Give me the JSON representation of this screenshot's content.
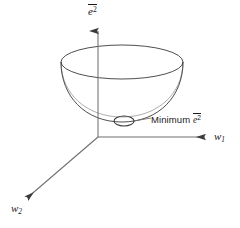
{
  "figure": {
    "background_color": "#ffffff",
    "stroke_color": "#3a3a3a",
    "text_color": "#1a1a1a",
    "width": 240,
    "height": 228
  },
  "axes": {
    "vertical": {
      "name": "vertical-axis",
      "base_symbol": "e",
      "superscript": "2",
      "has_overbar": true,
      "label_plain": "e̅2",
      "direction": "up",
      "origin": [
        98,
        137
      ],
      "tip": [
        98,
        28
      ]
    },
    "horizontal": {
      "name": "w1-axis",
      "base_symbol": "w",
      "subscript": "1",
      "has_overbar": false,
      "label_plain": "w1",
      "direction": "right",
      "origin": [
        98,
        137
      ],
      "tip": [
        211,
        137
      ]
    },
    "depth": {
      "name": "w2-axis",
      "base_symbol": "w",
      "subscript": "2",
      "has_overbar": false,
      "label_plain": "w2",
      "direction": "down-left",
      "origin": [
        98,
        137
      ],
      "tip": [
        23,
        202
      ]
    }
  },
  "surface": {
    "type": "paraboloid-bowl",
    "rim_ellipse": {
      "center_x": 122,
      "center_y": 62,
      "radius_x": 61,
      "radius_y": 17
    },
    "bowl_bottom_y": 122,
    "description": "Open bowl (paraboloid) error surface"
  },
  "annotation": {
    "minimum": {
      "text": "Minimum",
      "symbol_base": "e",
      "symbol_superscript": "2",
      "symbol_has_overbar": true,
      "full_label": "Minimum e̅2",
      "marker_shape": "ellipse",
      "marker_center": [
        124,
        121
      ],
      "marker_radius_x": 10,
      "marker_radius_y": 5,
      "leader_line_from": [
        134,
        121
      ],
      "leader_line_to": [
        150,
        118
      ]
    }
  }
}
